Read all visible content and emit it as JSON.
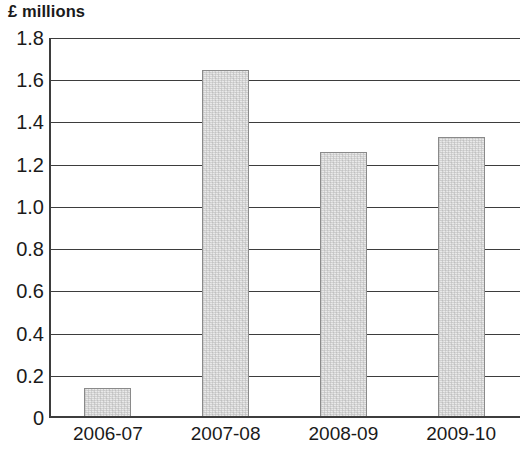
{
  "chart_data": {
    "type": "bar",
    "title": "£ millions",
    "xlabel": "",
    "ylabel": "",
    "categories": [
      "2006-07",
      "2007-08",
      "2008-09",
      "2009-10"
    ],
    "values": [
      0.14,
      1.65,
      1.26,
      1.33
    ],
    "ylim": [
      0,
      1.8
    ],
    "y_ticks": [
      "1.8",
      "1.6",
      "1.4",
      "1.2",
      "1.0",
      "0.8",
      "0.6",
      "0.4",
      "0.2",
      "0"
    ],
    "y_tick_values": [
      1.8,
      1.6,
      1.4,
      1.2,
      1.0,
      0.8,
      0.6,
      0.4,
      0.2,
      0
    ],
    "grid": true,
    "grid_orientation": "horizontal",
    "legend": null,
    "legend_position": "none",
    "series": [
      {
        "name": "£ millions",
        "values": [
          0.14,
          1.65,
          1.26,
          1.33
        ]
      }
    ],
    "colors": {
      "bar_fill": "#e9e9e9",
      "bar_border": "#8a8a8a",
      "axis": "#3d3d3d",
      "gridline": "#3d3d3d",
      "text": "#1a1a1a",
      "background": "#ffffff"
    }
  }
}
